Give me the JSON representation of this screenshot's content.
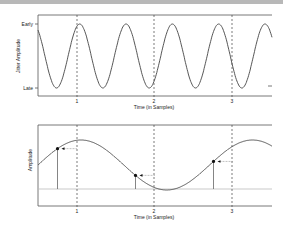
{
  "top_panel": {
    "ylabel": "Jitter Amplitude",
    "ytick_top": "Early",
    "ytick_bottom": "Late",
    "xlabel": "Time (in Samples)",
    "xticks": [
      "1",
      "2",
      "3"
    ]
  },
  "bottom_panel": {
    "ylabel": "Amplitude",
    "xlabel": "Time (in Samples)",
    "xticks": [
      "1",
      "2",
      "3"
    ]
  },
  "chart_data": [
    {
      "type": "line",
      "title": "",
      "xlabel": "Time (in Samples)",
      "ylabel": "Jitter Amplitude",
      "ytick_labels": [
        "Late",
        "Early"
      ],
      "xtick_labels": [
        "1",
        "2",
        "3"
      ],
      "xlim": [
        0.5,
        3.5
      ],
      "description": "Sinusoidal jitter oscillating between Late and Early, approx. 5 periods across the visible range",
      "periods_visible": 5,
      "sample_markers": [
        1,
        2,
        3
      ],
      "grid": false
    },
    {
      "type": "line",
      "title": "",
      "xlabel": "Time (in Samples)",
      "ylabel": "Amplitude",
      "xtick_labels": [
        "1",
        "2",
        "3"
      ],
      "xlim": [
        0.5,
        3.5
      ],
      "description": "Slow sinusoidal signal sampled early (jittered sample points shown with stems and arrows pointing from the nominal sample instant)",
      "sampled_points": [
        {
          "x": 0.75,
          "y": 0.55
        },
        {
          "x": 1.75,
          "y": 0.35
        },
        {
          "x": 2.75,
          "y": 0.3
        }
      ],
      "nominal_sample_times": [
        1,
        2,
        3
      ],
      "grid": false
    }
  ]
}
